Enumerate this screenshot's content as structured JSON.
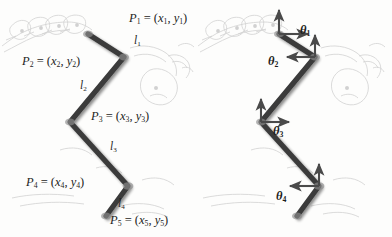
{
  "figure": {
    "panels": [
      {
        "id": "left",
        "caption": "point-and-link-labels"
      },
      {
        "id": "right",
        "caption": "joint-angle-labels"
      }
    ],
    "colors": {
      "chain": "#3a3a3a",
      "chain_shadow": "#b9b9b9",
      "arrow": "#4a4a4a",
      "background_sketch": "#cfcfcf",
      "text": "#1d1d1d",
      "page": "#fdfdfc"
    }
  },
  "left_panel": {
    "point_labels": [
      {
        "name": "P1",
        "text": "P",
        "sub": "1",
        "eq": " = (",
        "x_var": "x",
        "x_sub": "1",
        "comma": ", ",
        "y_var": "y",
        "y_sub": "1",
        "close": ")"
      },
      {
        "name": "P2",
        "text": "P",
        "sub": "2",
        "eq": " = (",
        "x_var": "x",
        "x_sub": "2",
        "comma": ", ",
        "y_var": "y",
        "y_sub": "2",
        "close": ")"
      },
      {
        "name": "P3",
        "text": "P",
        "sub": "3",
        "eq": " = (",
        "x_var": "x",
        "x_sub": "3",
        "comma": ", ",
        "y_var": "y",
        "y_sub": "3",
        "close": ")"
      },
      {
        "name": "P4",
        "text": "P",
        "sub": "4",
        "eq": " = (",
        "x_var": "x",
        "x_sub": "4",
        "comma": ", ",
        "y_var": "y",
        "y_sub": "4",
        "close": ")"
      },
      {
        "name": "P5",
        "text": "P",
        "sub": "5",
        "eq": " = (",
        "x_var": "x",
        "x_sub": "5",
        "comma": ", ",
        "y_var": "y",
        "y_sub": "5",
        "close": ")"
      }
    ],
    "segment_labels": [
      {
        "name": "l1",
        "text": "l",
        "sub": "1"
      },
      {
        "name": "l2",
        "text": "l",
        "sub": "2"
      },
      {
        "name": "l3",
        "text": "l",
        "sub": "3"
      },
      {
        "name": "l4",
        "text": "l",
        "sub": "4"
      }
    ]
  },
  "right_panel": {
    "angle_labels": [
      {
        "name": "theta1",
        "text": "θ",
        "sub": "1"
      },
      {
        "name": "theta2",
        "text": "θ",
        "sub": "2"
      },
      {
        "name": "theta3",
        "text": "θ",
        "sub": "3"
      },
      {
        "name": "theta4",
        "text": "θ",
        "sub": "4"
      }
    ]
  },
  "geometry": {
    "left_chain": [
      {
        "name": "P1",
        "x": 88,
        "y": 34
      },
      {
        "name": "P2",
        "x": 124,
        "y": 57
      },
      {
        "name": "P3",
        "x": 70,
        "y": 122
      },
      {
        "name": "P4",
        "x": 128,
        "y": 186
      },
      {
        "name": "P5",
        "x": 106,
        "y": 216
      }
    ],
    "right_chain": [
      {
        "name": "J1",
        "x": 279,
        "y": 34
      },
      {
        "name": "J2",
        "x": 315,
        "y": 57
      },
      {
        "name": "J3",
        "x": 261,
        "y": 122
      },
      {
        "name": "J4",
        "x": 319,
        "y": 186
      },
      {
        "name": "J5",
        "x": 297,
        "y": 216
      }
    ]
  }
}
